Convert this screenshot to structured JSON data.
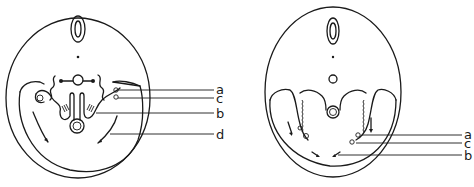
{
  "figure": {
    "panels": [
      {
        "id": "left",
        "labels": [
          {
            "text": "a",
            "y": 90
          },
          {
            "text": "c",
            "y": 99
          },
          {
            "text": "b",
            "y": 114
          },
          {
            "text": "d",
            "y": 135
          }
        ]
      },
      {
        "id": "right",
        "labels": [
          {
            "text": "a",
            "y": 135
          },
          {
            "text": "c",
            "y": 143
          },
          {
            "text": "b",
            "y": 155
          }
        ]
      }
    ],
    "line_color": "#1a1a1a",
    "background": "#ffffff"
  }
}
